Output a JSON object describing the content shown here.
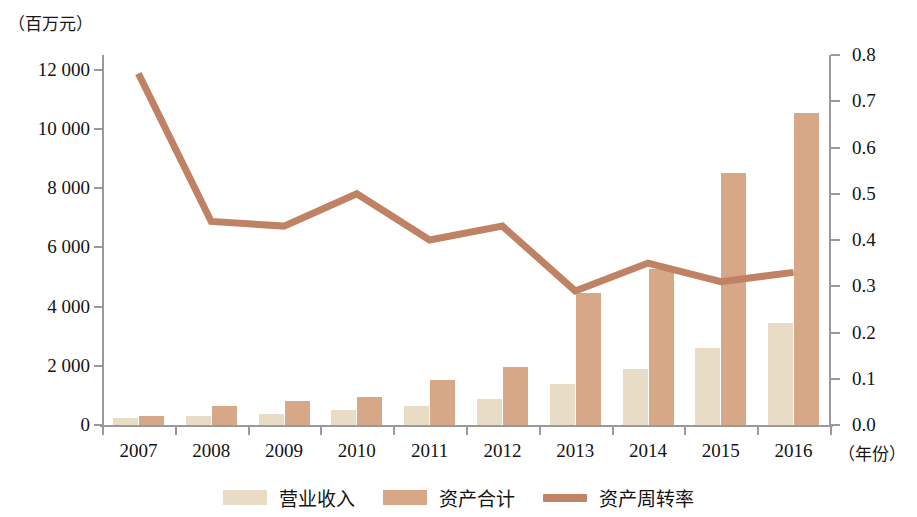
{
  "axes": {
    "left_unit_label": "（百万元）",
    "bottom_unit_label": "（年份）",
    "left_ticks": [
      "0",
      "2 000",
      "4 000",
      "6 000",
      "8 000",
      "10 000",
      "12 000"
    ],
    "right_ticks": [
      "0.0",
      "0.1",
      "0.2",
      "0.3",
      "0.4",
      "0.5",
      "0.6",
      "0.7",
      "0.8"
    ]
  },
  "legend": {
    "items": [
      {
        "label": "营业收入",
        "type": "bar",
        "color": "#e8dcc6",
        "name": "legend-revenue"
      },
      {
        "label": "资产合计",
        "type": "bar",
        "color": "#d7a888",
        "name": "legend-assets"
      },
      {
        "label": "资产周转率",
        "type": "line",
        "color": "#c08264",
        "name": "legend-turnover"
      }
    ]
  },
  "chart_data": {
    "type": "bar",
    "title": "",
    "xlabel": "（年份）",
    "ylabel": "（百万元）",
    "y2label": "",
    "categories": [
      "2007",
      "2008",
      "2009",
      "2010",
      "2011",
      "2012",
      "2013",
      "2014",
      "2015",
      "2016"
    ],
    "ylim": [
      0,
      12500
    ],
    "y2lim": [
      0,
      0.8
    ],
    "grid": false,
    "legend_position": "bottom",
    "series": [
      {
        "name": "营业收入",
        "type": "bar",
        "axis": "left",
        "color": "#e8dcc6",
        "values": [
          230,
          310,
          370,
          500,
          640,
          880,
          1370,
          1900,
          2600,
          3450
        ]
      },
      {
        "name": "资产合计",
        "type": "bar",
        "axis": "left",
        "color": "#d7a888",
        "values": [
          310,
          640,
          800,
          950,
          1510,
          1960,
          4470,
          5280,
          8500,
          10550
        ]
      },
      {
        "name": "资产周转率",
        "type": "line",
        "axis": "right",
        "color": "#c08264",
        "values": [
          0.76,
          0.44,
          0.43,
          0.5,
          0.4,
          0.43,
          0.29,
          0.35,
          0.31,
          0.33
        ]
      }
    ]
  }
}
